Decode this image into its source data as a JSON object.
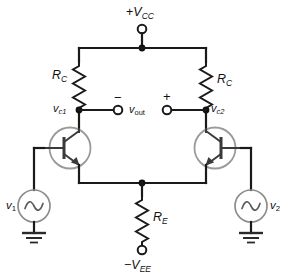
{
  "diagram": {
    "type": "schematic",
    "colors": {
      "wire": "#1a1a1a",
      "device_outline": "#9a9a9a",
      "device_internal": "#3a3a3a",
      "background": "#ffffff"
    }
  },
  "supplies": {
    "top": {
      "label_prefix": "+",
      "label_main": "V",
      "label_sub": "CC",
      "label_full": "+VCC"
    },
    "bottom": {
      "label_prefix": "−",
      "label_main": "V",
      "label_sub": "EE",
      "label_full": "−VEE"
    }
  },
  "resistors": [
    {
      "id": "rc-left",
      "label_main": "R",
      "label_sub": "C",
      "label_full": "RC",
      "side": "left",
      "label_position": "left"
    },
    {
      "id": "rc-right",
      "label_main": "R",
      "label_sub": "C",
      "label_full": "RC",
      "side": "right",
      "label_position": "right"
    },
    {
      "id": "re",
      "label_main": "R",
      "label_sub": "E",
      "label_full": "RE",
      "side": "center",
      "label_position": "right"
    }
  ],
  "nodes": [
    {
      "id": "vc1",
      "label_main": "v",
      "label_sub": "c1",
      "label_full": "vc1",
      "label_position": "left"
    },
    {
      "id": "vc2",
      "label_main": "v",
      "label_sub": "c2",
      "label_full": "vc2",
      "label_position": "right"
    }
  ],
  "output": {
    "label_main": "v",
    "label_sub": "out",
    "label_full": "vout",
    "negative_sign": "−",
    "positive_sign": "+"
  },
  "sources": [
    {
      "id": "v1",
      "label_main": "v",
      "label_sub": "1",
      "label_full": "v1",
      "symbol": "ac-sine",
      "label_position": "left",
      "ground": true
    },
    {
      "id": "v2",
      "label_main": "v",
      "label_sub": "2",
      "label_full": "v2",
      "symbol": "ac-sine",
      "label_position": "right",
      "ground": true
    }
  ],
  "transistors": [
    {
      "id": "q1",
      "type": "npn",
      "orientation": "base-left"
    },
    {
      "id": "q2",
      "type": "npn",
      "orientation": "base-right"
    }
  ]
}
